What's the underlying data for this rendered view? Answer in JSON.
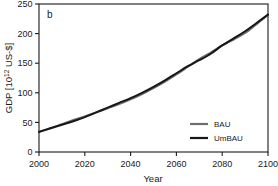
{
  "figure": {
    "panel_label": "b",
    "background": "#ffffff"
  },
  "chart_data": {
    "type": "line",
    "title": "",
    "subtitle": "",
    "xlabel": "Year",
    "ylabel": "GDP [10¹² US-$]",
    "ylabel_base": "GDP [10",
    "ylabel_exp": "12",
    "ylabel_tail": " US-$]",
    "panel_label": "b",
    "xlim": [
      2000,
      2100
    ],
    "ylim": [
      0,
      250
    ],
    "xticks": [
      2000,
      2020,
      2040,
      2060,
      2080,
      2100
    ],
    "xtick_labels": [
      "2000",
      "2020",
      "2040",
      "2060",
      "2080",
      "2100"
    ],
    "yticks": [
      0,
      50,
      100,
      150,
      200,
      250
    ],
    "ytick_labels": [
      "0",
      "50",
      "100",
      "150",
      "200",
      "250"
    ],
    "grid": false,
    "tick_direction": "out",
    "legend_position": "lower right",
    "x": [
      2000,
      2005,
      2010,
      2015,
      2020,
      2025,
      2030,
      2035,
      2040,
      2045,
      2050,
      2055,
      2060,
      2065,
      2070,
      2075,
      2080,
      2085,
      2090,
      2095,
      2100
    ],
    "series": [
      {
        "name": "BAU",
        "color": "#6e6e6e",
        "linewidth": 2.0,
        "values": [
          34,
          40,
          47,
          54,
          60,
          67,
          74,
          81,
          89,
          98,
          108,
          119,
          131,
          144,
          157,
          168,
          180,
          190,
          201,
          216,
          232
        ]
      },
      {
        "name": "UmBAU",
        "color": "#171717",
        "linewidth": 2.0,
        "values": [
          34,
          40,
          46,
          52,
          59,
          67,
          75,
          83,
          91,
          100,
          110,
          121,
          133,
          145,
          155,
          166,
          180,
          192,
          204,
          218,
          232
        ]
      }
    ]
  },
  "legend": {
    "entries": [
      {
        "label": "BAU",
        "color": "#6e6e6e"
      },
      {
        "label": "UmBAU",
        "color": "#171717"
      }
    ]
  }
}
